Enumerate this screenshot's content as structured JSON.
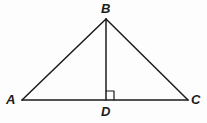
{
  "figure": {
    "name": "triangle-with-altitude",
    "background_color": "#fdfdfd",
    "stroke_color": "#1b1b1b",
    "stroke_width": 1.5,
    "width": 207,
    "height": 123
  },
  "labels": {
    "a": "A",
    "b": "B",
    "c": "C",
    "d": "D"
  },
  "points": {
    "A": {
      "x": 22,
      "y": 100
    },
    "B": {
      "x": 106,
      "y": 19
    },
    "C": {
      "x": 188,
      "y": 100
    },
    "D": {
      "x": 106,
      "y": 100
    }
  },
  "segments": [
    {
      "name": "side-AB",
      "from": "A",
      "to": "B"
    },
    {
      "name": "side-BC",
      "from": "B",
      "to": "C"
    },
    {
      "name": "base-AC",
      "from": "A",
      "to": "C"
    },
    {
      "name": "altitude-BD",
      "from": "B",
      "to": "D"
    }
  ],
  "right_angle_marker": {
    "name": "right-angle-at-D",
    "vertex": "D",
    "size": 8,
    "path": "M 106 91 L 114 91 L 114 100"
  }
}
